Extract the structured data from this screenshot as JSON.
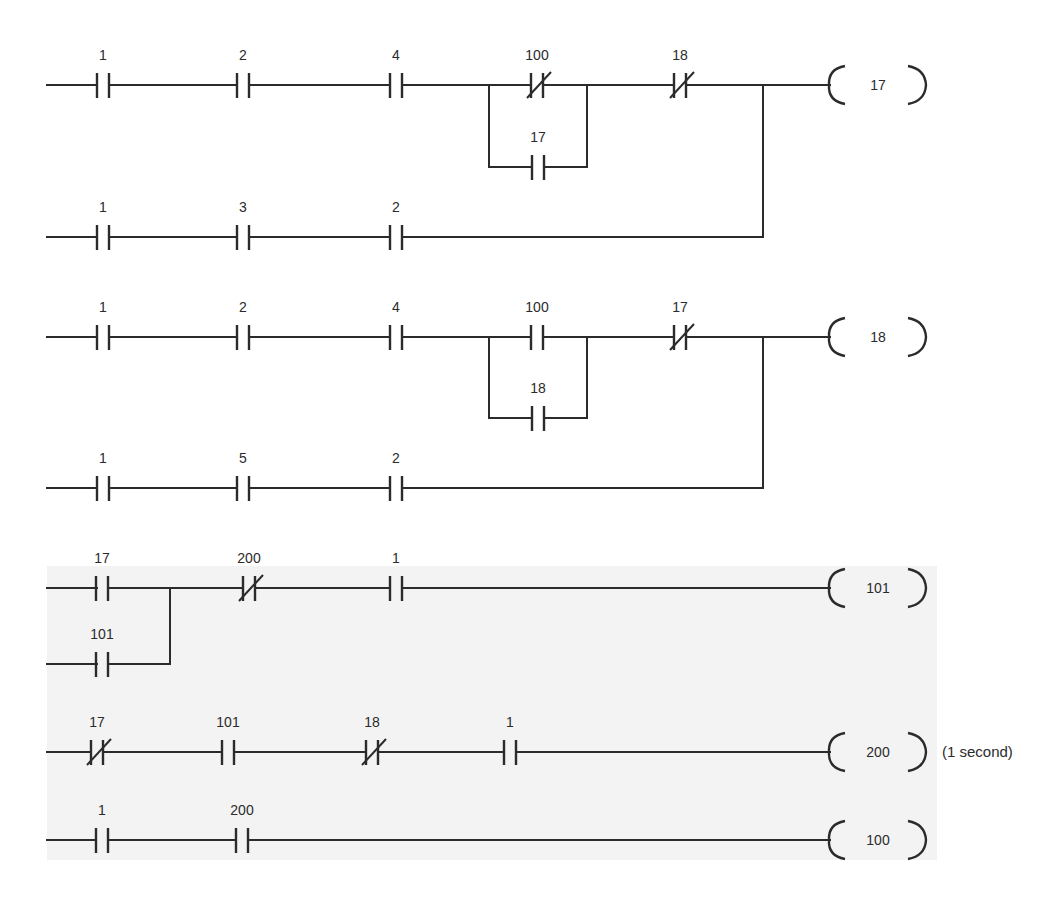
{
  "diagram": {
    "type": "ladder-logic",
    "colors": {
      "ink": "#2b2b2b",
      "background": "#ffffff",
      "shade": "#f3f3f3"
    },
    "shaded_region": {
      "x": 47,
      "y": 566,
      "w": 890,
      "h": 294
    },
    "rungs": [
      {
        "id": "rung-17",
        "coil": {
          "label": "17",
          "x": 878,
          "y": 85
        },
        "wires": [
          [
            47,
            85,
            97,
            85
          ],
          [
            109,
            85,
            237,
            85
          ],
          [
            249,
            85,
            390,
            85
          ],
          [
            402,
            85,
            531,
            85
          ],
          [
            543,
            85,
            674,
            85
          ],
          [
            686,
            85,
            830,
            85
          ],
          [
            489,
            85,
            489,
            167
          ],
          [
            587,
            85,
            587,
            167
          ],
          [
            489,
            167,
            532,
            167
          ],
          [
            545,
            167,
            587,
            167
          ],
          [
            47,
            237,
            97,
            237
          ],
          [
            109,
            237,
            237,
            237
          ],
          [
            249,
            237,
            390,
            237
          ],
          [
            402,
            237,
            763,
            237
          ],
          [
            763,
            85,
            763,
            237
          ]
        ],
        "contacts": [
          {
            "label": "1",
            "type": "NO",
            "x": 103,
            "y": 85
          },
          {
            "label": "2",
            "type": "NO",
            "x": 243,
            "y": 85
          },
          {
            "label": "4",
            "type": "NO",
            "x": 396,
            "y": 85
          },
          {
            "label": "100",
            "type": "NC",
            "x": 537,
            "y": 85
          },
          {
            "label": "17",
            "type": "NO",
            "x": 538,
            "y": 167
          },
          {
            "label": "18",
            "type": "NC",
            "x": 680,
            "y": 85
          },
          {
            "label": "1",
            "type": "NO",
            "x": 103,
            "y": 237
          },
          {
            "label": "3",
            "type": "NO",
            "x": 243,
            "y": 237
          },
          {
            "label": "2",
            "type": "NO",
            "x": 396,
            "y": 237
          }
        ]
      },
      {
        "id": "rung-18",
        "coil": {
          "label": "18",
          "x": 878,
          "y": 337
        },
        "wires": [
          [
            47,
            337,
            97,
            337
          ],
          [
            109,
            337,
            237,
            337
          ],
          [
            249,
            337,
            390,
            337
          ],
          [
            402,
            337,
            531,
            337
          ],
          [
            543,
            337,
            674,
            337
          ],
          [
            686,
            337,
            830,
            337
          ],
          [
            489,
            337,
            489,
            418
          ],
          [
            587,
            337,
            587,
            418
          ],
          [
            489,
            418,
            532,
            418
          ],
          [
            545,
            418,
            587,
            418
          ],
          [
            47,
            488,
            97,
            488
          ],
          [
            109,
            488,
            237,
            488
          ],
          [
            249,
            488,
            390,
            488
          ],
          [
            402,
            488,
            763,
            488
          ],
          [
            763,
            337,
            763,
            488
          ]
        ],
        "contacts": [
          {
            "label": "1",
            "type": "NO",
            "x": 103,
            "y": 337
          },
          {
            "label": "2",
            "type": "NO",
            "x": 243,
            "y": 337
          },
          {
            "label": "4",
            "type": "NO",
            "x": 396,
            "y": 337
          },
          {
            "label": "100",
            "type": "NO",
            "x": 537,
            "y": 337
          },
          {
            "label": "18",
            "type": "NO",
            "x": 538,
            "y": 418
          },
          {
            "label": "17",
            "type": "NC",
            "x": 680,
            "y": 337
          },
          {
            "label": "1",
            "type": "NO",
            "x": 103,
            "y": 488
          },
          {
            "label": "5",
            "type": "NO",
            "x": 243,
            "y": 488
          },
          {
            "label": "2",
            "type": "NO",
            "x": 396,
            "y": 488
          }
        ]
      },
      {
        "id": "rung-101",
        "coil": {
          "label": "101",
          "x": 878,
          "y": 588
        },
        "wires": [
          [
            47,
            588,
            97,
            588
          ],
          [
            109,
            588,
            243,
            588
          ],
          [
            255,
            588,
            390,
            588
          ],
          [
            402,
            588,
            830,
            588
          ],
          [
            47,
            664,
            97,
            664
          ],
          [
            109,
            664,
            170,
            664
          ],
          [
            170,
            588,
            170,
            664
          ]
        ],
        "contacts": [
          {
            "label": "17",
            "type": "NO",
            "x": 102,
            "y": 588
          },
          {
            "label": "101",
            "type": "NO",
            "x": 102,
            "y": 664
          },
          {
            "label": "200",
            "type": "NC",
            "x": 249,
            "y": 588
          },
          {
            "label": "1",
            "type": "NO",
            "x": 396,
            "y": 588
          }
        ]
      },
      {
        "id": "rung-200",
        "coil": {
          "label": "200",
          "x": 878,
          "y": 752
        },
        "note": {
          "text": "(1 second)",
          "x": 942,
          "y": 757
        },
        "wires": [
          [
            47,
            752,
            91,
            752
          ],
          [
            103,
            752,
            222,
            752
          ],
          [
            234,
            752,
            366,
            752
          ],
          [
            378,
            752,
            504,
            752
          ],
          [
            516,
            752,
            830,
            752
          ]
        ],
        "contacts": [
          {
            "label": "17",
            "type": "NC",
            "x": 97,
            "y": 752
          },
          {
            "label": "101",
            "type": "NO",
            "x": 228,
            "y": 752
          },
          {
            "label": "18",
            "type": "NC",
            "x": 372,
            "y": 752
          },
          {
            "label": "1",
            "type": "NO",
            "x": 510,
            "y": 752
          }
        ]
      },
      {
        "id": "rung-100",
        "coil": {
          "label": "100",
          "x": 878,
          "y": 840
        },
        "wires": [
          [
            47,
            840,
            96,
            840
          ],
          [
            108,
            840,
            236,
            840
          ],
          [
            248,
            840,
            830,
            840
          ]
        ],
        "contacts": [
          {
            "label": "1",
            "type": "NO",
            "x": 102,
            "y": 840
          },
          {
            "label": "200",
            "type": "NO",
            "x": 242,
            "y": 840
          }
        ]
      }
    ]
  }
}
